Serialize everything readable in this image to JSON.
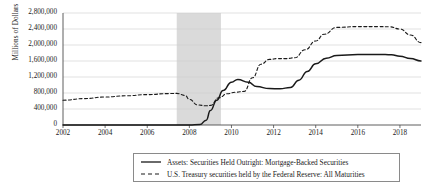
{
  "axis": {
    "ylabel": "Millions of Dollars",
    "yticks": [
      "0",
      "400,000",
      "800,000",
      "1,200,000",
      "1,600,000",
      "2,000,000",
      "2,400,000",
      "2,800,000"
    ],
    "xticks": [
      "2002",
      "2004",
      "2006",
      "2008",
      "2010",
      "2012",
      "2014",
      "2016",
      "2018"
    ]
  },
  "legend": {
    "items": [
      {
        "label": "Assets: Securities Held Outright: Mortgage-Backed Securities",
        "style": "solid"
      },
      {
        "label": "U.S. Treasury securities held by the Federal Reserve: All Maturities",
        "style": "dashed"
      }
    ]
  },
  "chart_data": {
    "type": "line",
    "title": "",
    "xlabel": "",
    "ylabel": "Millions of Dollars",
    "xlim": [
      2002,
      2019
    ],
    "ylim": [
      0,
      2800000
    ],
    "ytick_step": 400000,
    "grid": true,
    "legend_position": "bottom",
    "colors": {
      "series": "#1a1a1a",
      "recession_band": "#d4d4d4",
      "grid": "#cccccc"
    },
    "annotations": [
      {
        "type": "recession_band",
        "x_start": 2007.4,
        "x_end": 2009.5,
        "label": ""
      }
    ],
    "series": [
      {
        "name": "Assets: Securities Held Outright: Mortgage-Backed Securities",
        "style": "solid",
        "x": [
          2002,
          2003,
          2004,
          2005,
          2006,
          2007,
          2007.5,
          2008,
          2008.5,
          2008.8,
          2009,
          2009.3,
          2009.6,
          2010,
          2010.3,
          2010.8,
          2011.2,
          2011.8,
          2012.3,
          2012.8,
          2013.2,
          2013.6,
          2014,
          2014.5,
          2015,
          2016,
          2017,
          2017.6,
          2018,
          2018.5,
          2019
        ],
        "values": [
          0,
          0,
          0,
          0,
          0,
          0,
          0,
          0,
          10000,
          120000,
          360000,
          620000,
          860000,
          1070000,
          1140000,
          1070000,
          960000,
          910000,
          905000,
          940000,
          1120000,
          1340000,
          1530000,
          1670000,
          1740000,
          1760000,
          1765000,
          1755000,
          1720000,
          1660000,
          1600000
        ]
      },
      {
        "name": "U.S. Treasury securities held by the Federal Reserve: All Maturities",
        "style": "dashed",
        "x": [
          2002,
          2003,
          2004,
          2005,
          2006,
          2007,
          2007.4,
          2007.8,
          2008,
          2008.4,
          2008.8,
          2009,
          2009.4,
          2009.8,
          2010.2,
          2010.6,
          2011,
          2011.4,
          2011.8,
          2012.2,
          2012.6,
          2013,
          2013.5,
          2014,
          2014.4,
          2015,
          2016,
          2017,
          2017.5,
          2018,
          2018.5,
          2019
        ],
        "values": [
          620000,
          660000,
          700000,
          730000,
          760000,
          785000,
          790000,
          740000,
          640000,
          500000,
          480000,
          490000,
          680000,
          780000,
          820000,
          840000,
          1180000,
          1520000,
          1640000,
          1660000,
          1660000,
          1680000,
          1880000,
          2100000,
          2270000,
          2440000,
          2460000,
          2460000,
          2455000,
          2400000,
          2250000,
          2060000
        ]
      }
    ]
  }
}
